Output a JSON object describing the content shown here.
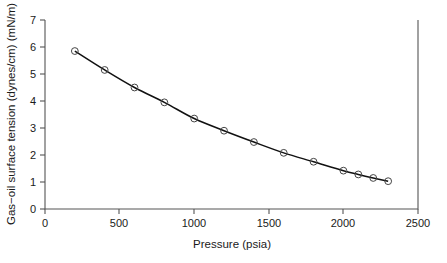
{
  "chart_data": {
    "type": "line",
    "title": "",
    "xlabel": "Pressure (psia)",
    "ylabel": "Gas−oil surface tension (dynes/cm) (mN/m)",
    "xlim": [
      0,
      2500
    ],
    "ylim": [
      0,
      7
    ],
    "xticks": [
      0,
      500,
      1000,
      1500,
      2000,
      2500
    ],
    "yticks": [
      0,
      1,
      2,
      3,
      4,
      5,
      6,
      7
    ],
    "xtick_labels": [
      "0",
      "500",
      "1000",
      "1500",
      "2000",
      "2500"
    ],
    "ytick_labels": [
      "0",
      "1",
      "2",
      "3",
      "4",
      "5",
      "6",
      "7"
    ],
    "grid": false,
    "legend": null,
    "marker": "open-circle",
    "line_color": "#111111",
    "marker_color": "#444444",
    "x": [
      200,
      400,
      600,
      800,
      1000,
      1200,
      1400,
      1600,
      1800,
      2000,
      2100,
      2200,
      2300
    ],
    "values": [
      5.85,
      5.15,
      4.5,
      3.95,
      3.35,
      2.9,
      2.48,
      2.08,
      1.75,
      1.42,
      1.28,
      1.15,
      1.03
    ],
    "series": [
      {
        "name": "Gas-oil surface tension",
        "x": [
          200,
          400,
          600,
          800,
          1000,
          1200,
          1400,
          1600,
          1800,
          2000,
          2100,
          2200,
          2300
        ],
        "values": [
          5.85,
          5.15,
          4.5,
          3.95,
          3.35,
          2.9,
          2.48,
          2.08,
          1.75,
          1.42,
          1.28,
          1.15,
          1.03
        ]
      }
    ]
  },
  "figure": {
    "background_color": "#ffffff",
    "axis_color": "#555555"
  }
}
